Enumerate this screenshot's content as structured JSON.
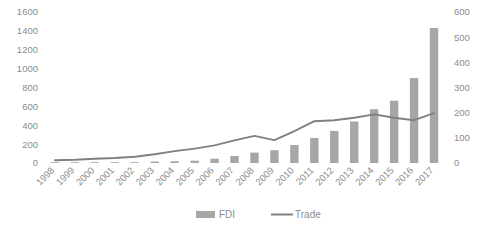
{
  "chart_data": {
    "type": "bar",
    "title": "",
    "subtitle": "",
    "xlabel": "",
    "ylabel": "",
    "grid": false,
    "legend_position": "bottom",
    "categories": [
      "1998",
      "1999",
      "2000",
      "2001",
      "2002",
      "2003",
      "2004",
      "2005",
      "2006",
      "2007",
      "2008",
      "2009",
      "2010",
      "2011",
      "2012",
      "2013",
      "2014",
      "2015",
      "2016",
      "2017"
    ],
    "series": [
      {
        "name": "FDI",
        "type": "bar",
        "axis": "left",
        "color": "#a6a6a6",
        "values": [
          3,
          4,
          5,
          6,
          8,
          15,
          18,
          25,
          45,
          75,
          110,
          135,
          190,
          265,
          340,
          440,
          570,
          660,
          900,
          1430
        ]
      },
      {
        "name": "Trade",
        "type": "line",
        "axis": "right",
        "color": "#808080",
        "values": [
          11,
          13,
          17,
          20,
          25,
          35,
          47,
          57,
          70,
          90,
          108,
          91,
          127,
          166,
          170,
          180,
          193,
          180,
          170,
          198
        ]
      }
    ],
    "left_axis": {
      "min": 0,
      "max": 1600,
      "step": 200,
      "ticks": [
        "0",
        "200",
        "400",
        "600",
        "800",
        "1000",
        "1200",
        "1400",
        "1600"
      ]
    },
    "right_axis": {
      "min": 0,
      "max": 600,
      "step": 100,
      "ticks": [
        "0",
        "100",
        "200",
        "300",
        "400",
        "500",
        "600"
      ]
    },
    "legend": [
      {
        "label": "FDI",
        "marker": "bar-swatch",
        "color": "#a6a6a6"
      },
      {
        "label": "Trade",
        "marker": "line-swatch",
        "color": "#808080"
      }
    ]
  }
}
